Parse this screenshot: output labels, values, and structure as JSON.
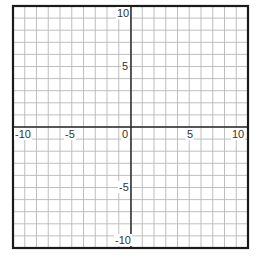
{
  "grid": {
    "x_min": -10,
    "x_max": 10,
    "y_min": -10,
    "y_max": 10,
    "step": 1,
    "label_step": 5,
    "border_color": "#1a1a1a",
    "grid_color": "#b8b8b8",
    "axis_color": "#2a2a2a"
  },
  "x_axis": {
    "labels": [
      "-10",
      "-5",
      "0",
      "5",
      "10"
    ]
  },
  "y_axis": {
    "labels": [
      "10",
      "5",
      "-5",
      "-10"
    ]
  }
}
